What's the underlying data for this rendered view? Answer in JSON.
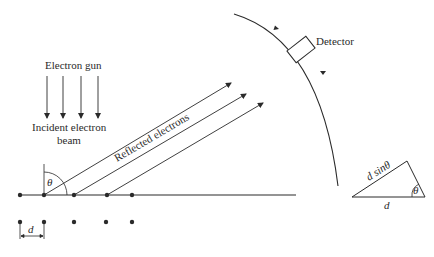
{
  "diagram": {
    "labels": {
      "electron_gun": "Electron gun",
      "incident_line1": "Incident electron",
      "incident_line2": "beam",
      "reflected": "Reflected  electrons",
      "detector": "Detector",
      "theta": "θ",
      "d_spacing": "d",
      "triangle_hyp": "d sinθ",
      "triangle_angle": "θ",
      "triangle_base": "d"
    },
    "colors": {
      "line": "#2a2a2a",
      "background": "#ffffff"
    },
    "incident_arrow_count": 4,
    "reflected_ray_count": 3,
    "lattice": {
      "top_row_atoms": 5,
      "bottom_row_atoms": 5
    }
  }
}
